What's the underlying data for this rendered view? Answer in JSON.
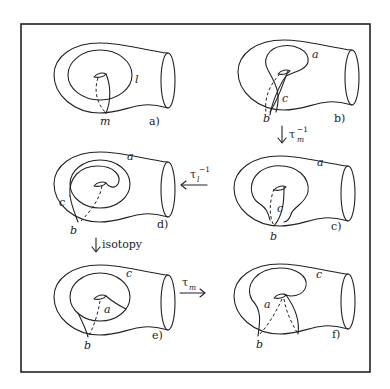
{
  "figure": {
    "panels": [
      {
        "id": "a",
        "label": "a)",
        "curve_labels": [
          "l",
          "m"
        ]
      },
      {
        "id": "b",
        "label": "b)",
        "curve_labels": [
          "a",
          "c",
          "b"
        ]
      },
      {
        "id": "c",
        "label": "c)",
        "curve_labels": [
          "a",
          "c",
          "b"
        ]
      },
      {
        "id": "d",
        "label": "d)",
        "curve_labels": [
          "a",
          "c",
          "b"
        ]
      },
      {
        "id": "e",
        "label": "e)",
        "curve_labels": [
          "c",
          "a",
          "b"
        ]
      },
      {
        "id": "f",
        "label": "f)",
        "curve_labels": [
          "c",
          "a",
          "b"
        ]
      }
    ],
    "arrows": [
      {
        "from": "b",
        "to": "c",
        "direction": "down",
        "op": "τ",
        "sub": "m",
        "sup": "−1"
      },
      {
        "from": "c",
        "to": "d",
        "direction": "left",
        "op": "τ",
        "sub": "l",
        "sup": "−1"
      },
      {
        "from": "d",
        "to": "e",
        "direction": "down",
        "op": "isotopy",
        "sub": "",
        "sup": ""
      },
      {
        "from": "e",
        "to": "f",
        "direction": "right",
        "op": "τ",
        "sub": "m",
        "sup": ""
      }
    ]
  },
  "labels": {
    "pa": "a)",
    "pb": "b)",
    "pc": "c)",
    "pd": "d)",
    "pe": "e)",
    "pf": "f)",
    "a_l": "l",
    "a_m": "m",
    "b_a": "a",
    "b_c": "c",
    "b_b": "b",
    "c_a": "a",
    "c_c": "c",
    "c_b": "b",
    "d_a": "a",
    "d_c": "c",
    "d_b": "b",
    "e_c": "c",
    "e_a": "a",
    "e_b": "b",
    "f_c": "c",
    "f_a": "a",
    "f_b": "b",
    "tau": "τ",
    "arr1_sub": "m",
    "arr1_sup": "−1",
    "arr2_sub": "l",
    "arr2_sup": "−1",
    "arr3": "isotopy",
    "arr4_sub": "m"
  },
  "colors": {
    "ink": "#222222",
    "background": "#ffffff"
  }
}
